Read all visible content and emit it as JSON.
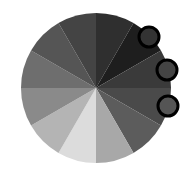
{
  "wheel": {
    "cx": 96,
    "cy": 88,
    "r": 75,
    "segments": [
      {
        "start": -90,
        "end": -60,
        "color": "#2f2f2f"
      },
      {
        "start": -60,
        "end": -30,
        "color": "#1e1e1e"
      },
      {
        "start": -30,
        "end": 0,
        "color": "#3a3a3a"
      },
      {
        "start": 0,
        "end": 30,
        "color": "#4a4a4a"
      },
      {
        "start": 30,
        "end": 60,
        "color": "#5c5c5c"
      },
      {
        "start": 60,
        "end": 90,
        "color": "#a8a8a8"
      },
      {
        "start": 90,
        "end": 120,
        "color": "#dcdcdc"
      },
      {
        "start": 120,
        "end": 150,
        "color": "#b4b4b4"
      },
      {
        "start": 150,
        "end": 180,
        "color": "#8a8a8a"
      },
      {
        "start": 180,
        "end": 210,
        "color": "#6e6e6e"
      },
      {
        "start": 210,
        "end": 240,
        "color": "#555555"
      },
      {
        "start": 240,
        "end": 270,
        "color": "#444444"
      }
    ]
  },
  "handles": [
    {
      "cx": 149,
      "cy": 37,
      "r": 10,
      "fill": "#333333"
    },
    {
      "cx": 167,
      "cy": 70,
      "r": 10,
      "fill": "#444444"
    },
    {
      "cx": 168,
      "cy": 106,
      "r": 10,
      "fill": "#555555"
    }
  ]
}
